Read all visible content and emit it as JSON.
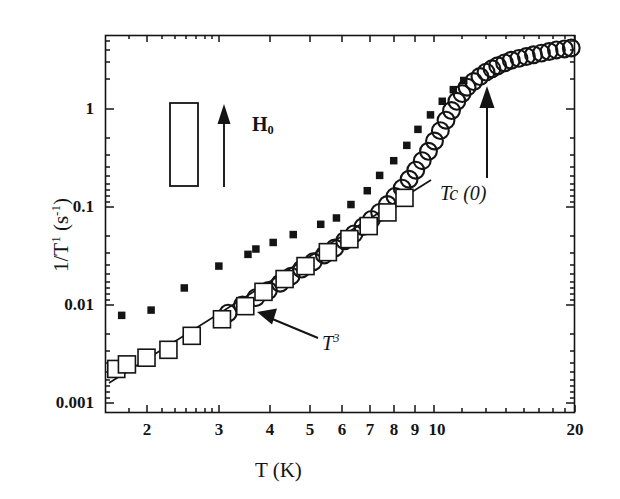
{
  "figure": {
    "background_color": "#ffffff",
    "ink_color": "#141414"
  },
  "axes": {
    "x_title": "T (K)",
    "y_title_main": "1/T",
    "y_title_sup": "1",
    "y_title_unit_open": " (s",
    "y_title_unit_sup": "-1",
    "y_title_unit_close": ")",
    "x_tick_labels": [
      "2",
      "3",
      "4",
      "5",
      "6",
      "7",
      "8",
      "9",
      "10",
      "20"
    ],
    "y_tick_labels": [
      "1",
      "0.1",
      "0.01",
      "0.001"
    ]
  },
  "annotations": {
    "power_law_base": "T",
    "power_law_exp": "3",
    "tc_label": "Tc (0)",
    "field_label_main": "H",
    "field_label_sub": "0"
  },
  "chart_data": {
    "type": "scatter",
    "title": "",
    "xlabel": "T (K)",
    "ylabel": "1/T1 (s^-1)",
    "xscale": "log",
    "yscale": "log",
    "xlim": [
      1.6,
      20
    ],
    "ylim": [
      0.001,
      6
    ],
    "grid": false,
    "legend_position": "none",
    "x_ticks": [
      2,
      3,
      4,
      5,
      6,
      7,
      8,
      9,
      10,
      20
    ],
    "y_ticks": [
      0.001,
      0.01,
      0.1,
      1
    ],
    "annotations": [
      {
        "text": "T^3",
        "x": 4.6,
        "y": 0.0052,
        "arrow_to_x": 3.35,
        "arrow_to_y": 0.0105
      },
      {
        "text": "Tc (0)",
        "x": 11.8,
        "y": 0.17,
        "arrow_to_x": 11.8,
        "arrow_to_y": 1.25
      },
      {
        "text": "H_0",
        "x": 2.85,
        "y": 0.62
      }
    ],
    "inset": {
      "type": "sample-geometry",
      "description": "vertical rectangle sample with upward field arrow labelled H0",
      "rect_x": 2.07,
      "rect_y_top": 1.05,
      "rect_y_bottom": 0.215
    },
    "series": [
      {
        "name": "open-squares",
        "marker": "open-square",
        "x": [
          1.7,
          1.8,
          2.0,
          2.25,
          2.55,
          3.0,
          3.4,
          3.75,
          4.2,
          4.7,
          5.3,
          5.95,
          6.6,
          7.3,
          8.0
        ],
        "y": [
          0.0027,
          0.003,
          0.0035,
          0.0042,
          0.0058,
          0.0085,
          0.0115,
          0.016,
          0.0215,
          0.029,
          0.04,
          0.054,
          0.073,
          0.1,
          0.14
        ]
      },
      {
        "name": "filled-squares",
        "marker": "filled-square",
        "x": [
          1.75,
          2.05,
          2.45,
          2.95,
          3.45,
          3.6,
          3.95,
          4.4,
          5.1,
          5.55,
          6.0,
          6.55,
          7.0,
          7.55,
          8.1,
          8.6,
          9.2,
          9.8,
          10.4,
          11.0
        ],
        "y": [
          0.0093,
          0.0105,
          0.0175,
          0.029,
          0.038,
          0.043,
          0.05,
          0.06,
          0.076,
          0.088,
          0.12,
          0.165,
          0.235,
          0.33,
          0.47,
          0.68,
          0.95,
          1.3,
          1.7,
          2.1
        ]
      },
      {
        "name": "open-circles",
        "marker": "open-circle",
        "x": [
          3.1,
          3.35,
          3.6,
          3.85,
          4.1,
          4.35,
          4.6,
          4.9,
          5.2,
          5.5,
          5.8,
          6.1,
          6.4,
          6.7,
          7.0,
          7.3,
          7.6,
          7.9,
          8.2,
          8.5,
          8.8,
          9.1,
          9.4,
          9.7,
          10.0,
          10.3,
          10.6,
          10.9,
          11.2,
          11.6,
          12.0,
          12.4,
          12.8,
          13.2,
          13.7,
          14.2,
          14.8,
          15.4,
          16.0,
          16.7,
          17.4,
          18.1,
          18.9,
          19.6
        ],
        "y": [
          0.0098,
          0.0118,
          0.014,
          0.0165,
          0.0195,
          0.023,
          0.027,
          0.032,
          0.0375,
          0.044,
          0.052,
          0.061,
          0.072,
          0.085,
          0.1,
          0.12,
          0.145,
          0.175,
          0.215,
          0.265,
          0.33,
          0.41,
          0.52,
          0.66,
          0.84,
          1.05,
          1.3,
          1.55,
          1.8,
          2.05,
          2.3,
          2.55,
          2.75,
          2.95,
          3.15,
          3.35,
          3.5,
          3.65,
          3.8,
          3.95,
          4.1,
          4.25,
          4.35,
          4.45
        ]
      }
    ],
    "fit_line": {
      "name": "T^3 power law",
      "type": "line",
      "x": [
        1.63,
        9.6
      ],
      "y": [
        0.00185,
        0.285
      ],
      "exponent": 3
    }
  }
}
